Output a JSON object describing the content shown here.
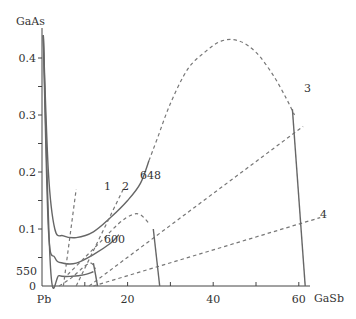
{
  "chart_data": {
    "type": "line",
    "title": "",
    "xlabel": "GaSb",
    "ylabel": "GaAs",
    "origin_label": "Pb",
    "xlim": [
      0,
      68
    ],
    "ylim": [
      0,
      0.45
    ],
    "x_ticks": [
      {
        "value": 0,
        "label": "Pb"
      },
      {
        "value": 10,
        "label": ""
      },
      {
        "value": 20,
        "label": "20"
      },
      {
        "value": 30,
        "label": ""
      },
      {
        "value": 40,
        "label": "40"
      },
      {
        "value": 50,
        "label": ""
      },
      {
        "value": 60,
        "label": "60"
      }
    ],
    "y_ticks": [
      {
        "value": 0,
        "label": "0"
      },
      {
        "value": 0.05,
        "label": ""
      },
      {
        "value": 0.1,
        "label": "0.1"
      },
      {
        "value": 0.15,
        "label": ""
      },
      {
        "value": 0.2,
        "label": "0.2"
      },
      {
        "value": 0.25,
        "label": ""
      },
      {
        "value": 0.3,
        "label": "0.3"
      },
      {
        "value": 0.35,
        "label": ""
      },
      {
        "value": 0.4,
        "label": "0.4"
      }
    ],
    "grid": false,
    "series": [
      {
        "name": "648",
        "style": "solid",
        "label": "648",
        "x": [
          0.3,
          1.5,
          3,
          5,
          8,
          12,
          16,
          20,
          23,
          25
        ],
        "y": [
          0.44,
          0.2,
          0.1,
          0.088,
          0.085,
          0.095,
          0.12,
          0.15,
          0.18,
          0.22
        ]
      },
      {
        "name": "600",
        "style": "solid",
        "label": "600",
        "x": [
          0.3,
          1.5,
          3,
          5,
          8,
          12,
          16,
          18
        ],
        "y": [
          0.44,
          0.1,
          0.05,
          0.04,
          0.04,
          0.055,
          0.075,
          0.09
        ]
      },
      {
        "name": "550",
        "style": "solid",
        "label": "550",
        "x": [
          0.3,
          2,
          4,
          7,
          10,
          12
        ],
        "y": [
          0.44,
          0.03,
          0.018,
          0.017,
          0.02,
          0.025
        ]
      },
      {
        "name": "liquidus-boundary",
        "style": "dashed",
        "label": "",
        "x": [
          25,
          27,
          30,
          34,
          38,
          42,
          46,
          50,
          54,
          57,
          59
        ],
        "y": [
          0.22,
          0.26,
          0.32,
          0.38,
          0.41,
          0.43,
          0.43,
          0.41,
          0.37,
          0.33,
          0.3
        ]
      },
      {
        "name": "phase-boundary-600",
        "style": "dashed",
        "label": "",
        "x": [
          6,
          10,
          14,
          18,
          21,
          23,
          25
        ],
        "y": [
          0.02,
          0.05,
          0.08,
          0.11,
          0.125,
          0.125,
          0.11
        ]
      },
      {
        "name": "phase-boundary-550",
        "style": "dashed",
        "label": "",
        "x": [
          4,
          7,
          10,
          11.5,
          12.5
        ],
        "y": [
          0.0,
          0.015,
          0.035,
          0.04,
          0.03
        ]
      },
      {
        "name": "tie-line-1",
        "style": "dashed",
        "label": "1",
        "x": [
          5,
          8
        ],
        "y": [
          0.0,
          0.17
        ]
      },
      {
        "name": "tie-line-2",
        "style": "dashed",
        "label": "2",
        "x": [
          8,
          19
        ],
        "y": [
          0.0,
          0.17
        ]
      },
      {
        "name": "tie-line-3",
        "style": "dashed",
        "label": "3",
        "x": [
          11,
          61
        ],
        "y": [
          0.0,
          0.28
        ]
      },
      {
        "name": "tie-line-4",
        "style": "dashed",
        "label": "4",
        "x": [
          12,
          65
        ],
        "y": [
          0.0,
          0.12
        ]
      },
      {
        "name": "solidus-650",
        "style": "solid",
        "label": "",
        "x": [
          58.5,
          61.5
        ],
        "y": [
          0.31,
          0.0
        ]
      },
      {
        "name": "solidus-600",
        "style": "solid",
        "label": "",
        "x": [
          26,
          27.5
        ],
        "y": [
          0.1,
          0.0
        ]
      },
      {
        "name": "solidus-550",
        "style": "solid",
        "label": "",
        "x": [
          12,
          13
        ],
        "y": [
          0.04,
          0.0
        ]
      }
    ],
    "annotations": [
      "1",
      "2",
      "3",
      "4",
      "550",
      "600",
      "648"
    ],
    "legend": "none"
  }
}
